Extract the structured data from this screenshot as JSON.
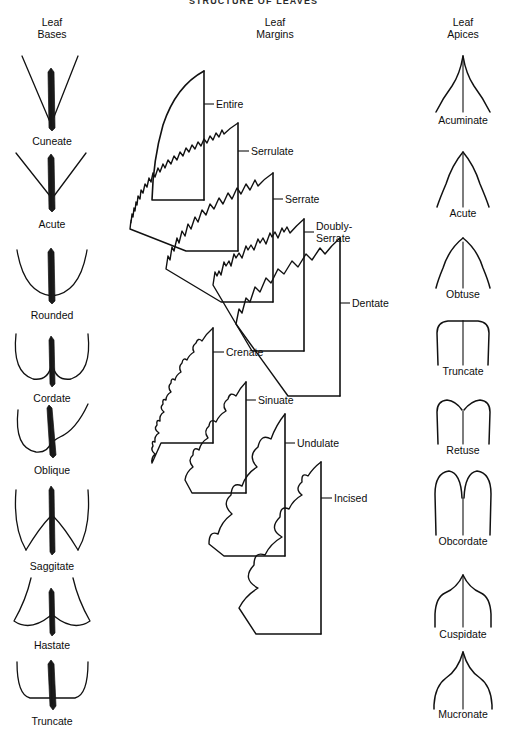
{
  "figure": {
    "title": "STRUCTURE OF LEAVES",
    "ink_color": "#111111",
    "background_color": "#ffffff"
  },
  "columns": [
    {
      "id": "leaf-bases",
      "header_line1": "Leaf",
      "header_line2": "Bases",
      "center_x": 52,
      "items": [
        {
          "name": "Cuneate",
          "label_y": 141
        },
        {
          "name": "Acute",
          "label_y": 224
        },
        {
          "name": "Rounded",
          "label_y": 315
        },
        {
          "name": "Cordate",
          "label_y": 398
        },
        {
          "name": "Oblique",
          "label_y": 470
        },
        {
          "name": "Saggitate",
          "label_y": 566
        },
        {
          "name": "Hastate",
          "label_y": 645
        },
        {
          "name": "Truncate",
          "label_y": 721
        }
      ]
    },
    {
      "id": "leaf-margins",
      "header_line1": "Leaf",
      "header_line2": "Margins",
      "center_x": 275,
      "items": [
        {
          "name": "Entire",
          "label_x": 216,
          "label_y": 99,
          "leader_x1": 204,
          "leader_x2": 214,
          "leader_y": 104
        },
        {
          "name": "Serrulate",
          "label_x": 251,
          "label_y": 146,
          "leader_x1": 238,
          "leader_x2": 249,
          "leader_y": 151
        },
        {
          "name": "Serrate",
          "label_x": 285,
          "label_y": 194,
          "leader_x1": 273,
          "leader_x2": 283,
          "leader_y": 199
        },
        {
          "name": "Doubly-",
          "name2": "Serrate",
          "label_x": 316,
          "label_y": 227,
          "leader_x1": 304,
          "leader_x2": 314,
          "leader_y": 232
        },
        {
          "name": "Dentate",
          "label_x": 352,
          "label_y": 298,
          "leader_x1": 340,
          "leader_x2": 350,
          "leader_y": 303
        },
        {
          "name": "Crenate",
          "label_x": 226,
          "label_y": 347,
          "leader_x1": 213,
          "leader_x2": 224,
          "leader_y": 352
        },
        {
          "name": "Sinuate",
          "label_x": 258,
          "label_y": 395,
          "leader_x1": 246,
          "leader_x2": 256,
          "leader_y": 400
        },
        {
          "name": "Undulate",
          "label_x": 297,
          "label_y": 438,
          "leader_x1": 285,
          "leader_x2": 295,
          "leader_y": 443
        },
        {
          "name": "Incised",
          "label_x": 334,
          "label_y": 493,
          "leader_x1": 321,
          "leader_x2": 332,
          "leader_y": 498
        }
      ]
    },
    {
      "id": "leaf-apices",
      "header_line1": "Leaf",
      "header_line2": "Apices",
      "center_x": 463,
      "items": [
        {
          "name": "Acuminate",
          "label_y": 120
        },
        {
          "name": "Acute",
          "label_y": 213
        },
        {
          "name": "Obtuse",
          "label_y": 294
        },
        {
          "name": "Truncate",
          "label_y": 371
        },
        {
          "name": "Retuse",
          "label_y": 450
        },
        {
          "name": "Obcordate",
          "label_y": 541
        },
        {
          "name": "Cuspidate",
          "label_y": 634
        },
        {
          "name": "Mucronate",
          "label_y": 714
        }
      ]
    }
  ]
}
